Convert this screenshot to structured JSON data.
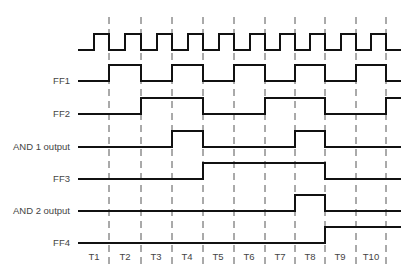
{
  "diagram": {
    "title": "",
    "signals": [
      {
        "name": "clock",
        "label": "",
        "baseline_y": 50
      },
      {
        "name": "ff1",
        "label": "FF1",
        "baseline_y": 81
      },
      {
        "name": "ff2",
        "label": "FF2",
        "baseline_y": 114
      },
      {
        "name": "and1",
        "label": "AND 1 output",
        "baseline_y": 147
      },
      {
        "name": "ff3",
        "label": "FF3",
        "baseline_y": 179
      },
      {
        "name": "and2",
        "label": "AND 2 output",
        "baseline_y": 211
      },
      {
        "name": "ff4",
        "label": "FF4",
        "baseline_y": 243
      }
    ],
    "time_labels": [
      "T1",
      "T2",
      "T3",
      "T4",
      "T5",
      "T6",
      "T7",
      "T8",
      "T9",
      "T10"
    ],
    "boundaries_x": [
      109,
      141,
      172,
      203,
      234,
      265,
      295,
      325,
      356,
      386
    ],
    "start_x": 78,
    "end_x": 401,
    "high_offset": 16,
    "waveforms": {
      "ff1": [
        [
          109,
          141
        ],
        [
          172,
          203
        ],
        [
          234,
          265
        ],
        [
          295,
          325
        ],
        [
          356,
          386
        ]
      ],
      "ff2": [
        [
          141,
          203
        ],
        [
          265,
          325
        ],
        [
          386,
          401
        ]
      ],
      "and1": [
        [
          172,
          203
        ],
        [
          295,
          325
        ]
      ],
      "ff3": [
        [
          203,
          325
        ]
      ],
      "and2": [
        [
          295,
          325
        ]
      ],
      "ff4": [
        [
          325,
          401
        ]
      ]
    },
    "colors": {
      "line": "#111111",
      "dash": "#555555",
      "text": "#444444"
    }
  }
}
